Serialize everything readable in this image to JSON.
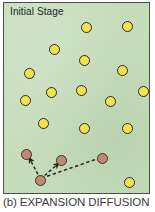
{
  "figure": {
    "stage_label": "Initial Stage",
    "caption": "(b) EXPANSION DIFFUSION",
    "colors": {
      "panel_background": "#c6ddbb",
      "panel_border": "#4a4f46",
      "nonadopter_fill": "#f2e34f",
      "nonadopter_stroke": "#2b2b22",
      "adopter_fill": "#c08a72",
      "adopter_stroke": "#3b2f28",
      "arrow_stroke": "#24241c",
      "caption_text": "#3b3b36"
    }
  },
  "chart_data": {
    "type": "scatter",
    "title": "Initial Stage",
    "subtitle": "(b) EXPANSION DIFFUSION",
    "xlabel": "",
    "ylabel": "",
    "xlim": [
      0,
      147
    ],
    "ylim": [
      0,
      192
    ],
    "grid": false,
    "legend": "none",
    "series": [
      {
        "name": "Non-adopters",
        "marker": "circle",
        "fill": "#f2e34f",
        "stroke": "#2b2b22",
        "count": 16,
        "points": [
          {
            "x": 83,
            "y": 25
          },
          {
            "x": 124,
            "y": 24
          },
          {
            "x": 51,
            "y": 47
          },
          {
            "x": 81,
            "y": 58
          },
          {
            "x": 119,
            "y": 68
          },
          {
            "x": 26,
            "y": 71
          },
          {
            "x": 48,
            "y": 90
          },
          {
            "x": 78,
            "y": 88
          },
          {
            "x": 140,
            "y": 89
          },
          {
            "x": 22,
            "y": 98
          },
          {
            "x": 107,
            "y": 99
          },
          {
            "x": 40,
            "y": 121
          },
          {
            "x": 81,
            "y": 126
          },
          {
            "x": 124,
            "y": 126
          },
          {
            "x": 126,
            "y": 180
          },
          {
            "x": 0,
            "y": 0
          }
        ]
      },
      {
        "name": "Source adopter",
        "marker": "circle",
        "fill": "#c08a72",
        "stroke": "#3b2f28",
        "count": 1,
        "points": [
          {
            "x": 37,
            "y": 178
          }
        ]
      },
      {
        "name": "New adopters",
        "marker": "circle",
        "fill": "#c08a72",
        "stroke": "#3b2f28",
        "count": 3,
        "points": [
          {
            "x": 23,
            "y": 152
          },
          {
            "x": 58,
            "y": 158
          },
          {
            "x": 99,
            "y": 156
          }
        ]
      }
    ],
    "annotations": {
      "type": "dashed-arrows",
      "description": "Dashed arrows from the source adopter to three new adopters",
      "arrows": [
        {
          "from": {
            "x": 37,
            "y": 178
          },
          "to": {
            "x": 23,
            "y": 152
          }
        },
        {
          "from": {
            "x": 37,
            "y": 178
          },
          "to": {
            "x": 58,
            "y": 158
          }
        },
        {
          "from": {
            "x": 37,
            "y": 178
          },
          "to": {
            "x": 99,
            "y": 156
          }
        }
      ]
    }
  },
  "nodes": {
    "nonadopters": [
      {
        "left": 77,
        "top": 19
      },
      {
        "left": 118,
        "top": 18
      },
      {
        "left": 45,
        "top": 41
      },
      {
        "left": 75,
        "top": 52
      },
      {
        "left": 113,
        "top": 62
      },
      {
        "left": 20,
        "top": 65
      },
      {
        "left": 42,
        "top": 84
      },
      {
        "left": 72,
        "top": 82
      },
      {
        "left": 134,
        "top": 83
      },
      {
        "left": 16,
        "top": 92
      },
      {
        "left": 101,
        "top": 93
      },
      {
        "left": 34,
        "top": 115
      },
      {
        "left": 75,
        "top": 120
      },
      {
        "left": 118,
        "top": 120
      },
      {
        "left": 120,
        "top": 174
      }
    ],
    "adopters": [
      {
        "left": 17,
        "top": 146
      },
      {
        "left": 52,
        "top": 152
      },
      {
        "left": 93,
        "top": 150
      }
    ],
    "source": {
      "left": 31,
      "top": 172
    }
  }
}
